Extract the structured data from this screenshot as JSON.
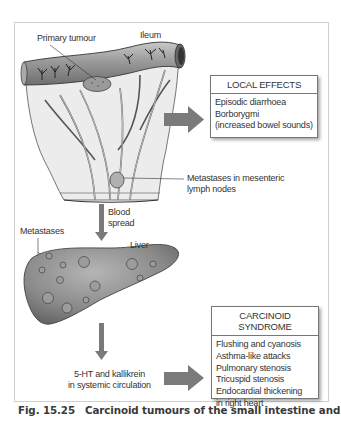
{
  "labels": {
    "primary_tumour": "Primary tumour",
    "ileum": "Ileum",
    "mesenteric_metastases_line1": "Metastases in mesenteric",
    "mesenteric_metastases_line2": "lymph nodes",
    "blood_spread_line1": "Blood",
    "blood_spread_line2": "spread",
    "metastases": "Metastases",
    "liver": "Liver",
    "circulation_line1": "5-HT and kallikrein",
    "circulation_line2": "in systemic circulation"
  },
  "local_effects": {
    "title": "LOCAL EFFECTS",
    "items": [
      "Episodic diarrhoea",
      "Borborygmi",
      "(increased bowel sounds)"
    ]
  },
  "carcinoid_syndrome": {
    "title": "CARCINOID SYNDROME",
    "items": [
      "Flushing and cyanosis",
      "Asthma-like attacks",
      "Pulmonary stenosis",
      "Tricuspid stenosis",
      "Endocardial thickening",
      "in right heart"
    ]
  },
  "caption": {
    "number": "Fig. 15.25",
    "text": "Carcinoid tumours of the small intestine and"
  },
  "colors": {
    "arrow": "#7a7a7a",
    "organ": "#8e8e8e",
    "mesentery": "#e9e9e9",
    "box_border": "#777777"
  }
}
